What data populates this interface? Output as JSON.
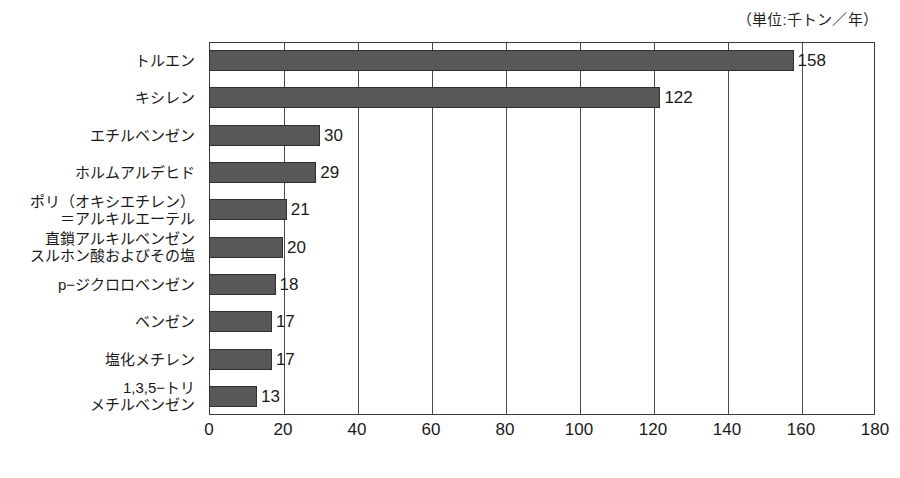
{
  "chart_data": {
    "type": "bar",
    "orientation": "horizontal",
    "title": "",
    "subtitle": "",
    "unit_note": "（単位:千トン／年）",
    "xlabel": "",
    "ylabel": "",
    "xlim": [
      0,
      180
    ],
    "xticks": [
      0,
      20,
      40,
      60,
      80,
      100,
      120,
      140,
      160,
      180
    ],
    "xtick_labels": [
      "0",
      "20",
      "40",
      "60",
      "80",
      "100",
      "120",
      "140",
      "160",
      "180"
    ],
    "grid": true,
    "grid_axis": "x",
    "legend": false,
    "bar_color": "#585858",
    "bar_edge_color": "#2f2f2f",
    "axis_color": "#3a3a3a",
    "categories": [
      "トルエン",
      "キシレン",
      "エチルベンゼン",
      "ホルムアルデヒド",
      "ポリ（オキシエチレン）\n＝アルキルエーテル",
      "直鎖アルキルベンゼン\nスルホン酸およびその塩",
      "p−ジクロロベンゼン",
      "ベンゼン",
      "塩化メチレン",
      "1,3,5−トリ\nメチルベンゼン"
    ],
    "values": [
      158,
      122,
      30,
      29,
      21,
      20,
      18,
      17,
      17,
      13
    ],
    "value_labels": [
      "158",
      "122",
      "30",
      "29",
      "21",
      "20",
      "18",
      "17",
      "17",
      "13"
    ]
  }
}
